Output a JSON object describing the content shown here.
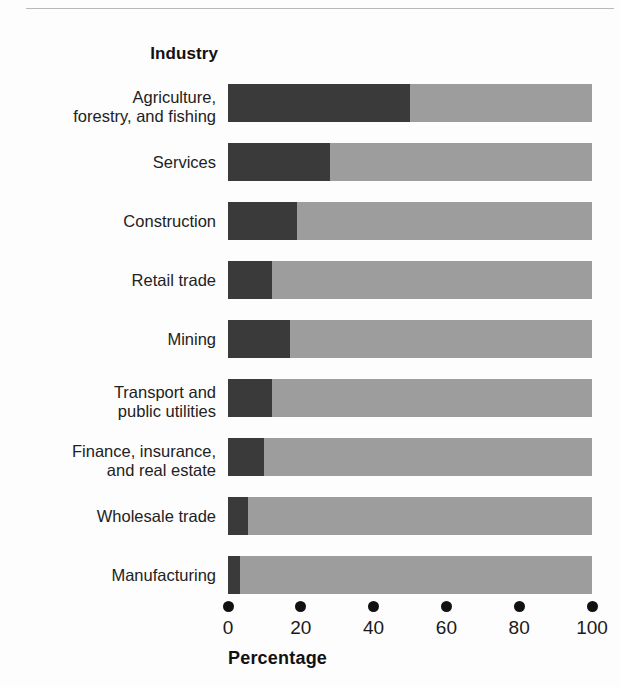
{
  "figure": {
    "background_color": "#fdfdfd",
    "divider_color": "#b8b8b8"
  },
  "category_axis": {
    "title": "Industry"
  },
  "value_axis": {
    "title": "Percentage",
    "tick_labels": [
      "0",
      "20",
      "40",
      "60",
      "80",
      "100"
    ],
    "tick_values": [
      0,
      20,
      40,
      60,
      80,
      100
    ]
  },
  "colors": {
    "dark_segment": "#3a3a3a",
    "light_segment": "#9d9d9d"
  },
  "chart_data": {
    "type": "bar",
    "orientation": "horizontal",
    "stacked": true,
    "title": "",
    "xlabel": "Percentage",
    "ylabel": "Industry",
    "xlim": [
      0,
      100
    ],
    "grid": false,
    "legend": "none",
    "categories": [
      "Agriculture, forestry, and fishing",
      "Services",
      "Construction",
      "Retail trade",
      "Mining",
      "Transport and public utilities",
      "Finance, insurance, and real estate",
      "Wholesale trade",
      "Manufacturing"
    ],
    "category_lines": [
      [
        "Agriculture,",
        "forestry, and fishing"
      ],
      [
        "Services"
      ],
      [
        "Construction"
      ],
      [
        "Retail trade"
      ],
      [
        "Mining"
      ],
      [
        "Transport and",
        "public utilities"
      ],
      [
        "Finance, insurance,",
        "and real estate"
      ],
      [
        "Wholesale trade"
      ],
      [
        "Manufacturing"
      ]
    ],
    "series": [
      {
        "name": "dark-segment",
        "color": "#3a3a3a",
        "values": [
          50,
          28,
          19,
          12,
          17,
          12,
          10,
          5.5,
          3.3
        ]
      },
      {
        "name": "light-segment",
        "color": "#9d9d9d",
        "values": [
          50,
          72,
          81,
          88,
          83,
          88,
          90,
          94.5,
          96.7
        ]
      }
    ],
    "values": [
      50,
      28,
      19,
      12,
      17,
      12,
      10,
      5.5,
      3.3
    ]
  }
}
